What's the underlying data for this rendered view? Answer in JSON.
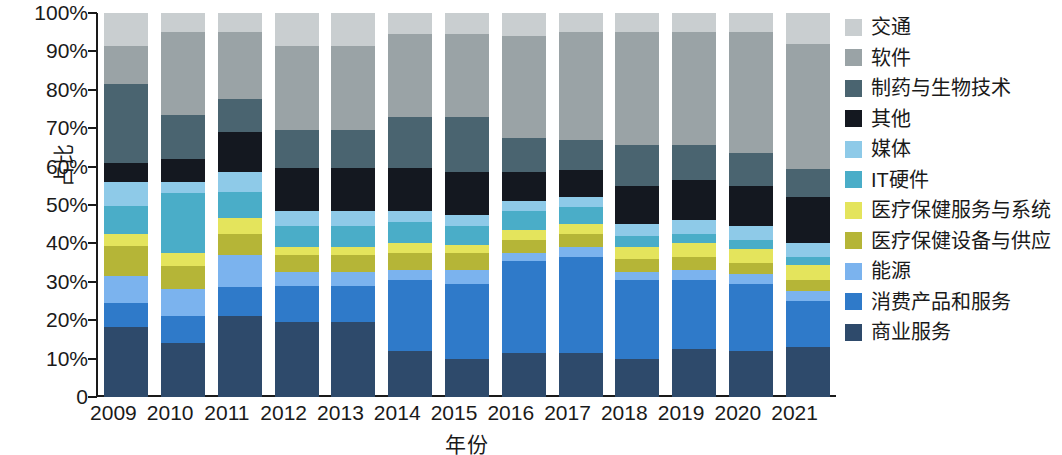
{
  "chart_data": {
    "type": "bar",
    "subtype": "stacked-percentage",
    "title": "",
    "xlabel": "年份",
    "ylabel": "占比",
    "ylim": [
      0,
      100
    ],
    "yticks": [
      0,
      10,
      20,
      30,
      40,
      50,
      60,
      70,
      80,
      90,
      100
    ],
    "ytick_labels": [
      "0",
      "10%",
      "20%",
      "30%",
      "40%",
      "50%",
      "60%",
      "70%",
      "80%",
      "90%",
      "100%"
    ],
    "grid": false,
    "legend_position": "right",
    "categories": [
      "2009",
      "2010",
      "2011",
      "2012",
      "2013",
      "2014",
      "2015",
      "2016",
      "2017",
      "2018",
      "2019",
      "2020",
      "2021"
    ],
    "series": [
      {
        "name": "商业服务",
        "color": "#2e4a6b",
        "values": [
          17.0,
          14.0,
          21.0,
          19.5,
          19.5,
          12.0,
          10.0,
          11.5,
          11.5,
          10.0,
          12.5,
          12.0,
          13.0
        ]
      },
      {
        "name": "消费产品和服务",
        "color": "#2f7ac9",
        "values": [
          6.0,
          7.0,
          7.5,
          9.5,
          9.5,
          18.5,
          19.5,
          24.0,
          25.0,
          20.5,
          18.0,
          17.5,
          12.0
        ]
      },
      {
        "name": "能源",
        "color": "#7bb3ee",
        "values": [
          6.5,
          7.0,
          8.5,
          3.5,
          3.5,
          2.5,
          3.5,
          2.0,
          2.5,
          2.0,
          2.5,
          2.5,
          2.5
        ]
      },
      {
        "name": "医疗保健设备与供应",
        "color": "#b5b537",
        "values": [
          7.5,
          6.0,
          5.5,
          4.5,
          4.5,
          4.5,
          4.5,
          3.5,
          3.5,
          3.5,
          3.5,
          3.0,
          3.0
        ]
      },
      {
        "name": "医疗保健服务与系统",
        "color": "#e4e45c",
        "values": [
          3.0,
          3.5,
          4.0,
          2.0,
          2.0,
          2.5,
          2.0,
          2.5,
          2.5,
          3.0,
          3.5,
          3.5,
          4.0
        ]
      },
      {
        "name": "IT硬件",
        "color": "#4aadc8",
        "values": [
          6.8,
          15.5,
          7.0,
          5.5,
          5.5,
          5.5,
          5.0,
          5.0,
          4.5,
          3.0,
          2.5,
          2.5,
          2.0
        ]
      },
      {
        "name": "媒体",
        "color": "#8ecae8",
        "values": [
          5.7,
          3.0,
          5.0,
          4.0,
          4.0,
          3.0,
          3.0,
          2.5,
          2.5,
          3.0,
          3.5,
          3.5,
          3.5
        ]
      },
      {
        "name": "其他",
        "color": "#141820",
        "values": [
          4.8,
          6.0,
          10.5,
          11.0,
          11.0,
          11.0,
          11.0,
          7.5,
          7.0,
          10.0,
          10.5,
          10.5,
          12.0
        ]
      },
      {
        "name": "制药与生物技术",
        "color": "#4a6470",
        "values": [
          19.2,
          11.5,
          8.5,
          10.0,
          10.0,
          13.5,
          14.5,
          9.0,
          8.0,
          10.5,
          9.0,
          8.5,
          7.5
        ]
      },
      {
        "name": "软件",
        "color": "#9aa3a6",
        "values": [
          9.5,
          21.5,
          17.5,
          22.0,
          22.0,
          21.5,
          21.5,
          26.5,
          28.0,
          29.5,
          29.5,
          31.5,
          32.5
        ]
      },
      {
        "name": "交通",
        "color": "#c9ced0",
        "values": [
          8.0,
          5.0,
          5.0,
          8.5,
          8.5,
          5.5,
          5.5,
          6.0,
          5.0,
          5.0,
          5.0,
          5.0,
          8.0
        ]
      }
    ],
    "legend_order_top_to_bottom": [
      {
        "label": "交通",
        "color": "#c9ced0"
      },
      {
        "label": "软件",
        "color": "#9aa3a6"
      },
      {
        "label": "制药与生物技术",
        "color": "#4a6470"
      },
      {
        "label": "其他",
        "color": "#141820"
      },
      {
        "label": "媒体",
        "color": "#8ecae8"
      },
      {
        "label": "IT硬件",
        "color": "#4aadc8"
      },
      {
        "label": "医疗保健服务与系统",
        "color": "#e4e45c"
      },
      {
        "label": "医疗保健设备与供应",
        "color": "#b5b537"
      },
      {
        "label": "能源",
        "color": "#7bb3ee"
      },
      {
        "label": "消费产品和服务",
        "color": "#2f7ac9"
      },
      {
        "label": "商业服务",
        "color": "#2e4a6b"
      }
    ]
  }
}
